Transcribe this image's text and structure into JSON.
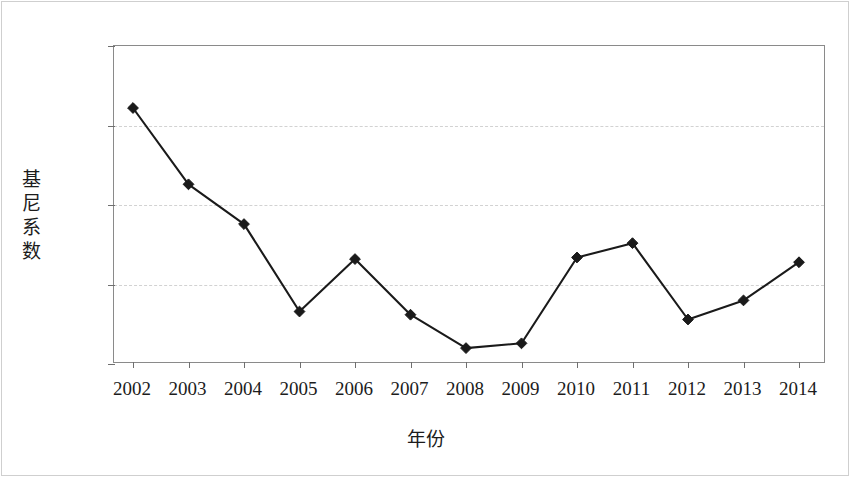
{
  "figure": {
    "background_color": "#ffffff",
    "frame_color": "#cfcfcf",
    "axis_color": "#8a8a8a",
    "grid_color": "#d2d2d2",
    "series_color": "#1a1a1a"
  },
  "chart_data": {
    "type": "line",
    "title": "",
    "xlabel": "年份",
    "ylabel": "基尼系数",
    "categories": [
      "2002",
      "2003",
      "2004",
      "2005",
      "2006",
      "2007",
      "2008",
      "2009",
      "2010",
      "2011",
      "2012",
      "2013",
      "2014"
    ],
    "values": [
      0.611,
      0.563,
      0.538,
      0.483,
      0.516,
      0.481,
      0.46,
      0.463,
      0.517,
      0.526,
      0.478,
      0.49,
      0.514
    ],
    "ylim": [
      0.45,
      0.65
    ],
    "yticks": [
      0.45,
      0.5,
      0.55,
      0.6,
      0.65
    ],
    "ytick_labels": [
      "0.45",
      "0.50",
      "0.55",
      "0.60",
      "0.65"
    ],
    "grid": true,
    "grid_axis": "y",
    "legend": false,
    "legend_position": "none",
    "marker": "diamond",
    "series": [
      {
        "name": "基尼系数",
        "values": [
          0.611,
          0.563,
          0.538,
          0.483,
          0.516,
          0.481,
          0.46,
          0.463,
          0.517,
          0.526,
          0.478,
          0.49,
          0.514
        ]
      }
    ]
  }
}
